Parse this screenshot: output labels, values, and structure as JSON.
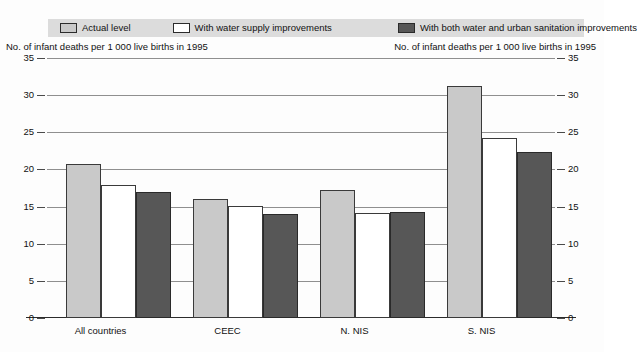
{
  "legend": {
    "items": [
      {
        "label": "Actual level",
        "color": "#c9c9c9",
        "key": "actual"
      },
      {
        "label": "With water supply improvements",
        "color": "#ffffff",
        "key": "water"
      },
      {
        "label": "With both water and urban sanitation improvements",
        "color": "#575757",
        "key": "water_sanitation"
      }
    ],
    "background": "#dcdcdc"
  },
  "axis_caption_left": "No. of infant deaths per 1 000 live births in 1995",
  "axis_caption_right": "No. of infant deaths per 1 000 live births in 1995",
  "chart_data": {
    "type": "bar",
    "title": "",
    "subtitle": "",
    "xlabel": "",
    "ylabel": "No. of infant deaths per 1 000 live births in 1995",
    "ylim": [
      0,
      35
    ],
    "yticks": [
      0,
      5,
      10,
      15,
      20,
      25,
      30,
      35
    ],
    "ytick_labels": [
      "0",
      "5",
      "10",
      "15",
      "20",
      "25",
      "30",
      "35"
    ],
    "grid": true,
    "grid_axis": "y",
    "dual_y_axis": true,
    "legend_position": "top",
    "categories": [
      "All countries",
      "CEEC",
      "N. NIS",
      "S. NIS"
    ],
    "series": [
      {
        "name": "Actual level",
        "color": "#c9c9c9",
        "values": [
          20.7,
          16.0,
          17.2,
          31.3
        ]
      },
      {
        "name": "With water supply improvements",
        "color": "#ffffff",
        "values": [
          17.9,
          15.1,
          14.2,
          24.3
        ]
      },
      {
        "name": "With both water and urban sanitation improvements",
        "color": "#575757",
        "values": [
          16.9,
          14.0,
          14.3,
          22.3
        ]
      }
    ]
  }
}
